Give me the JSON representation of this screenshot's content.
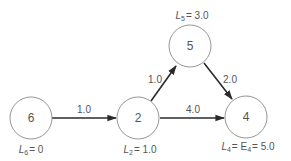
{
  "diagram": {
    "type": "network-graph",
    "nodes": [
      {
        "id": "6",
        "label": "6",
        "annotation_var": "L",
        "annotation_sub": "6",
        "annotation_rest": "= 0"
      },
      {
        "id": "2",
        "label": "2",
        "annotation_var": "L",
        "annotation_sub": "2",
        "annotation_rest": "= 1.0"
      },
      {
        "id": "5",
        "label": "5",
        "annotation_var": "L",
        "annotation_sub": "5",
        "annotation_rest": "= 3.0"
      },
      {
        "id": "4",
        "label": "4",
        "annotation_var": "L",
        "annotation_sub": "4",
        "annotation_mid": "= E",
        "annotation_sub2": "4",
        "annotation_rest": "= 5.0"
      }
    ],
    "edges": [
      {
        "from": "6",
        "to": "2",
        "weight": "1.0"
      },
      {
        "from": "2",
        "to": "5",
        "weight": "1.0"
      },
      {
        "from": "2",
        "to": "4",
        "weight": "4.0"
      },
      {
        "from": "5",
        "to": "4",
        "weight": "2.0"
      }
    ]
  }
}
